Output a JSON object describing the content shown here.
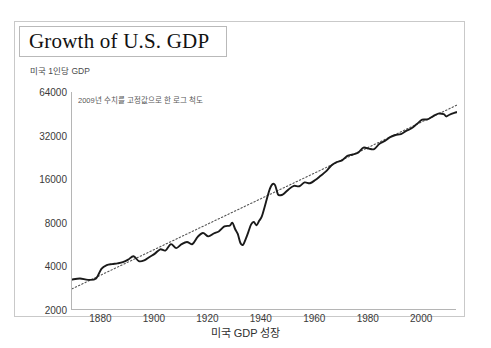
{
  "figure": {
    "title": "Growth of U.S. GDP",
    "axis_caption": "미국 1인당 GDP",
    "plot_subtitle": "2009년 수치를 고정값으로 한 로그 척도",
    "caption": "미국 GDP 성장"
  },
  "colors": {
    "line": "#1a1a1a",
    "trend": "#555555",
    "axis": "#b5b5b5",
    "frame": "#c9c9c9",
    "title_border": "#b9b9b9",
    "text": "#3a3a3a",
    "background": "#ffffff"
  },
  "chart_data": {
    "type": "line",
    "title": "Growth of U.S. GDP",
    "subtitle": "2009년 수치를 고정값으로 한 로그 척도",
    "xlabel": "",
    "ylabel": "미국 1인당 GDP",
    "yscale": "log2",
    "ylim": [
      2000,
      64000
    ],
    "xlim": [
      1869,
      2013
    ],
    "grid": false,
    "legend": "none",
    "ytick_labels": [
      "64000",
      "32000",
      "16000",
      "8000",
      "4000",
      "2000"
    ],
    "yticks": [
      64000,
      32000,
      16000,
      8000,
      4000,
      2000
    ],
    "xtick_labels": [
      "1880",
      "1900",
      "1920",
      "1940",
      "1960",
      "1980",
      "2000"
    ],
    "xticks": [
      1880,
      1900,
      1920,
      1940,
      1960,
      1980,
      2000
    ],
    "series": [
      {
        "name": "Real GDP per capita (2009 dollars)",
        "style": "solid",
        "x": [
          1869,
          1872,
          1875,
          1878,
          1880,
          1882,
          1884,
          1886,
          1888,
          1890,
          1892,
          1894,
          1896,
          1898,
          1900,
          1902,
          1904,
          1906,
          1908,
          1910,
          1912,
          1914,
          1916,
          1918,
          1920,
          1922,
          1924,
          1926,
          1928,
          1929,
          1930,
          1931,
          1932,
          1933,
          1934,
          1935,
          1936,
          1937,
          1938,
          1939,
          1940,
          1941,
          1942,
          1943,
          1944,
          1945,
          1946,
          1947,
          1948,
          1950,
          1952,
          1954,
          1956,
          1958,
          1960,
          1962,
          1964,
          1966,
          1968,
          1970,
          1972,
          1974,
          1976,
          1978,
          1980,
          1982,
          1984,
          1986,
          1988,
          1990,
          1992,
          1994,
          1996,
          1998,
          2000,
          2002,
          2004,
          2006,
          2008,
          2009,
          2010,
          2012,
          2013
        ],
        "y": [
          3250,
          3300,
          3230,
          3300,
          3850,
          4080,
          4150,
          4200,
          4280,
          4450,
          4700,
          4350,
          4400,
          4650,
          4900,
          5250,
          5150,
          5700,
          5350,
          5700,
          5900,
          5700,
          6400,
          6800,
          6450,
          6750,
          7000,
          7550,
          7650,
          8000,
          7250,
          6700,
          5800,
          5650,
          6200,
          6950,
          7800,
          8100,
          7700,
          8250,
          8850,
          10200,
          11900,
          13700,
          14800,
          14500,
          12600,
          12400,
          12600,
          13600,
          14400,
          14300,
          15200,
          15000,
          15800,
          16900,
          18100,
          19900,
          21000,
          21600,
          23200,
          23700,
          24400,
          26400,
          26000,
          25800,
          28100,
          29400,
          31200,
          32300,
          32800,
          34500,
          36000,
          38500,
          41200,
          41400,
          43500,
          45400,
          45000,
          43400,
          44400,
          45900,
          46500
        ]
      },
      {
        "name": "Long-run trend",
        "style": "dotted",
        "x": [
          1869,
          2013
        ],
        "y": [
          2800,
          52000
        ]
      }
    ],
    "annotations": [
      {
        "label": "Great Depression trough",
        "x": 1933,
        "y": 5650
      },
      {
        "label": "WWII peak",
        "x": 1944,
        "y": 14800
      }
    ]
  }
}
